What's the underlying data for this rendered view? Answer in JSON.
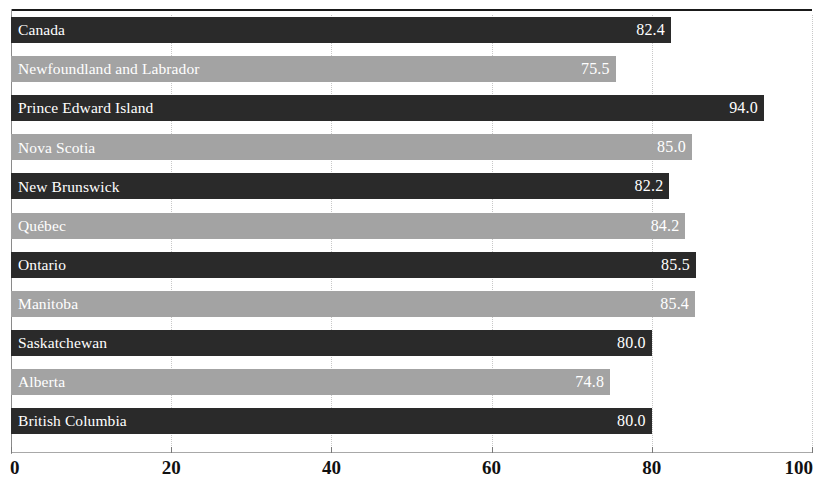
{
  "chart_data": {
    "type": "bar",
    "orientation": "horizontal",
    "title": "",
    "subtitle": "",
    "xlabel": "",
    "ylabel": "",
    "xlim": [
      0,
      100
    ],
    "xticks": [
      "0",
      "20",
      "40",
      "60",
      "80",
      "100"
    ],
    "xtick_values": [
      0,
      20,
      40,
      60,
      80,
      100
    ],
    "grid": "vertical dotted gridlines at each 20-unit tick",
    "legend": "none",
    "categories": [
      "Canada",
      "Newfoundland and Labrador",
      "Prince Edward Island",
      "Nova Scotia",
      "New Brunswick",
      "Québec",
      "Ontario",
      "Manitoba",
      "Saskatchewan",
      "Alberta",
      "British Columbia"
    ],
    "values": [
      82.4,
      75.5,
      94.0,
      85.0,
      82.2,
      84.2,
      85.5,
      85.4,
      80.0,
      74.8,
      80.0
    ],
    "value_labels": [
      "82.4",
      "75.5",
      "94.0",
      "85.0",
      "82.2",
      "84.2",
      "85.5",
      "85.4",
      "80.0",
      "74.8",
      "80.0"
    ],
    "bar_shades": [
      "dark",
      "light",
      "dark",
      "light",
      "dark",
      "light",
      "dark",
      "light",
      "dark",
      "light",
      "dark"
    ],
    "colors": {
      "bar_dark": "#2a2a2a",
      "bar_light": "#a3a3a3",
      "label_text": "#ffffff",
      "axis_text": "#111111",
      "gridline": "#c8c8c8",
      "axis_line": "#9a9a9a",
      "top_rule": "#1a1a1a",
      "background": "#ffffff"
    },
    "bars": [
      {
        "category": "Canada",
        "value": 82.4,
        "label": "82.4",
        "shade": "dark"
      },
      {
        "category": "Newfoundland and Labrador",
        "value": 75.5,
        "label": "75.5",
        "shade": "light"
      },
      {
        "category": "Prince Edward Island",
        "value": 94.0,
        "label": "94.0",
        "shade": "dark"
      },
      {
        "category": "Nova Scotia",
        "value": 85.0,
        "label": "85.0",
        "shade": "light"
      },
      {
        "category": "New Brunswick",
        "value": 82.2,
        "label": "82.2",
        "shade": "dark"
      },
      {
        "category": "Québec",
        "value": 84.2,
        "label": "84.2",
        "shade": "light"
      },
      {
        "category": "Ontario",
        "value": 85.5,
        "label": "85.5",
        "shade": "dark"
      },
      {
        "category": "Manitoba",
        "value": 85.4,
        "label": "85.4",
        "shade": "light"
      },
      {
        "category": "Saskatchewan",
        "value": 80.0,
        "label": "80.0",
        "shade": "dark"
      },
      {
        "category": "Alberta",
        "value": 74.8,
        "label": "74.8",
        "shade": "light"
      },
      {
        "category": "British Columbia",
        "value": 80.0,
        "label": "80.0",
        "shade": "dark"
      }
    ]
  }
}
